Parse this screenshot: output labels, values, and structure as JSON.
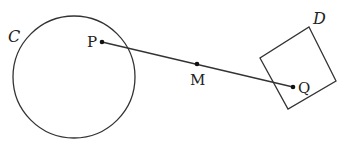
{
  "diagram": {
    "circle": {
      "label": "C",
      "cx": 74,
      "cy": 77,
      "r": 61
    },
    "square": {
      "label": "D",
      "points": [
        [
          309,
          27
        ],
        [
          336,
          81
        ],
        [
          288,
          109
        ],
        [
          260,
          58
        ]
      ]
    },
    "segment": {
      "from": "P",
      "to": "Q"
    },
    "points": {
      "P": {
        "label": "P",
        "x": 102,
        "y": 42
      },
      "M": {
        "label": "M",
        "x": 197,
        "y": 64
      },
      "Q": {
        "label": "Q",
        "x": 293,
        "y": 87
      }
    },
    "stroke_color": "#333333"
  }
}
